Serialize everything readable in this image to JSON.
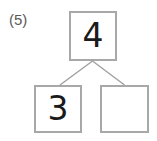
{
  "worksheet": {
    "problem_label": "(5)",
    "diagram_type": "number-bond",
    "colors": {
      "box_border": "#a8a8a8",
      "digit": "#1a1a1a",
      "label": "#5a5a5a",
      "connector_line": "#a0a0a0",
      "background": "#ffffff"
    },
    "number_bond": {
      "whole": {
        "name": "whole-box",
        "value": "4",
        "filled": true
      },
      "parts": [
        {
          "name": "part-box-left",
          "value": "3",
          "filled": true
        },
        {
          "name": "part-box-right",
          "value": "",
          "filled": false
        }
      ]
    }
  }
}
